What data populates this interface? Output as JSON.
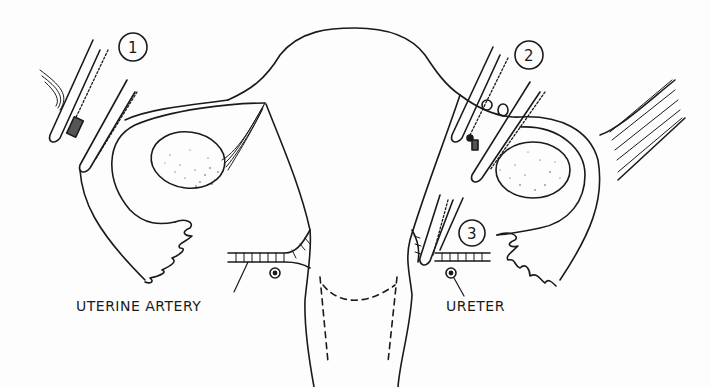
{
  "figure": {
    "type": "surgical-illustration",
    "labels": {
      "uterine_artery": "UTERINE ARTERY",
      "ureter": "URETER"
    },
    "clamps": [
      {
        "number": "1",
        "position": "left infundibulopelvic ligament"
      },
      {
        "number": "2",
        "position": "right adnexa (two clamps)"
      },
      {
        "number": "3",
        "position": "right uterine artery"
      }
    ],
    "markers": [
      {
        "symbol": "⊛",
        "meaning": "ureter cross-section",
        "side": "left"
      },
      {
        "symbol": "⊛",
        "meaning": "ureter cross-section",
        "side": "right"
      }
    ],
    "colors": {
      "line": "#1a1a1a",
      "background": "#fdfdfd"
    }
  }
}
